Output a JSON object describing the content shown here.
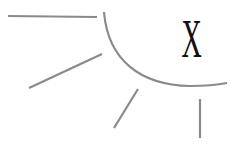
{
  "figure": {
    "numeral": "X",
    "colors": {
      "stroke": "#8a8a8a",
      "numeral": "#111111",
      "background": "#ffffff"
    },
    "strokes": [
      {
        "name": "horizontal-tick",
        "x1": 8,
        "y1": 16,
        "x2": 97,
        "y2": 17
      },
      {
        "name": "diagonal-tick-upper",
        "x1": 29,
        "y1": 88,
        "x2": 102,
        "y2": 54
      },
      {
        "name": "diagonal-tick-lower",
        "x1": 114,
        "y1": 128,
        "x2": 138,
        "y2": 89
      },
      {
        "name": "vertical-tick",
        "x1": 200,
        "y1": 99,
        "x2": 200,
        "y2": 138
      }
    ],
    "arc": {
      "start": [
        104,
        12
      ],
      "control": [
        118,
        88
      ],
      "end": [
        227,
        83
      ]
    }
  }
}
